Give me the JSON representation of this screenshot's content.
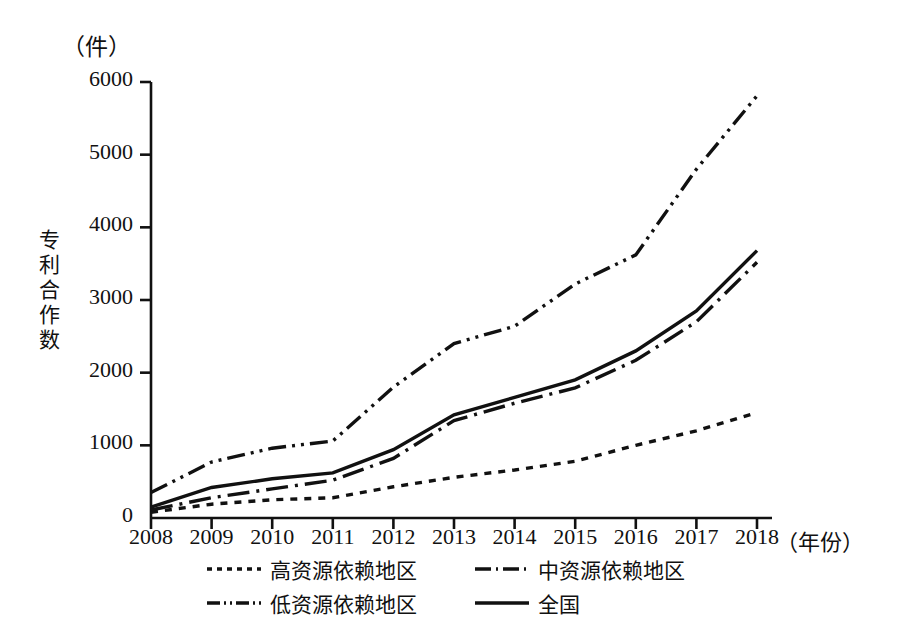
{
  "chart_data": {
    "type": "line",
    "title": "",
    "unit_label": "（件）",
    "ylabel": "专利合作数",
    "xlabel": "（年份）",
    "grid": false,
    "legend_position": "bottom",
    "categories": [
      2008,
      2009,
      2010,
      2011,
      2012,
      2013,
      2014,
      2015,
      2016,
      2017,
      2018
    ],
    "xtick_labels": [
      "2008",
      "2009",
      "2010",
      "2011",
      "2012",
      "2013",
      "2014",
      "2015",
      "2016",
      "2017",
      "2018"
    ],
    "ytick_labels": [
      "0",
      "1000",
      "2000",
      "3000",
      "4000",
      "5000",
      "6000"
    ],
    "ytick_values": [
      0,
      1000,
      2000,
      3000,
      4000,
      5000,
      6000
    ],
    "ylim": [
      0,
      6000
    ],
    "xlim": [
      2008,
      2018
    ],
    "series": [
      {
        "name": "高资源依赖地区",
        "style": "dotted",
        "color": "#111111",
        "values": [
          80,
          190,
          250,
          280,
          430,
          560,
          660,
          780,
          1000,
          1200,
          1450
        ]
      },
      {
        "name": "中资源依赖地区",
        "style": "dashdot",
        "color": "#111111",
        "values": [
          110,
          280,
          400,
          520,
          820,
          1340,
          1580,
          1790,
          2170,
          2700,
          3520
        ]
      },
      {
        "name": "低资源依赖地区",
        "style": "dashdotdot",
        "color": "#111111",
        "values": [
          350,
          770,
          960,
          1060,
          1800,
          2400,
          2640,
          3220,
          3620,
          4800,
          5810
        ]
      },
      {
        "name": "全国",
        "style": "solid",
        "color": "#111111",
        "values": [
          150,
          420,
          540,
          620,
          940,
          1420,
          1660,
          1900,
          2300,
          2850,
          3680
        ]
      }
    ]
  },
  "legend": {
    "rows": [
      [
        {
          "label": "高资源依赖地区",
          "style": "dotted"
        },
        {
          "label": "中资源依赖地区",
          "style": "dashdot"
        }
      ],
      [
        {
          "label": "低资源依赖地区",
          "style": "dashdotdot"
        },
        {
          "label": "全国",
          "style": "solid"
        }
      ]
    ]
  }
}
